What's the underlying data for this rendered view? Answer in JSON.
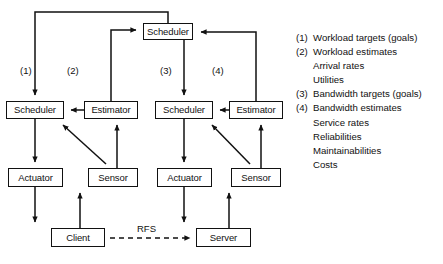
{
  "diagram": {
    "stroke_color": "#111111",
    "background_color": "#ffffff",
    "nodes": [
      {
        "id": "global-scheduler",
        "label": "Scheduler",
        "x": 143,
        "y": 23,
        "w": 50,
        "h": 17
      },
      {
        "id": "left-scheduler",
        "label": "Scheduler",
        "x": 6,
        "y": 101,
        "w": 58,
        "h": 18
      },
      {
        "id": "left-estimator",
        "label": "Estimator",
        "x": 84,
        "y": 101,
        "w": 54,
        "h": 18
      },
      {
        "id": "right-scheduler",
        "label": "Scheduler",
        "x": 155,
        "y": 101,
        "w": 58,
        "h": 18
      },
      {
        "id": "right-estimator",
        "label": "Estimator",
        "x": 229,
        "y": 101,
        "w": 54,
        "h": 18
      },
      {
        "id": "left-actuator",
        "label": "Actuator",
        "x": 8,
        "y": 168,
        "w": 55,
        "h": 19
      },
      {
        "id": "left-sensor",
        "label": "Sensor",
        "x": 88,
        "y": 168,
        "w": 50,
        "h": 19
      },
      {
        "id": "right-actuator",
        "label": "Actuator",
        "x": 157,
        "y": 168,
        "w": 55,
        "h": 19
      },
      {
        "id": "right-sensor",
        "label": "Sensor",
        "x": 231,
        "y": 168,
        "w": 50,
        "h": 19
      },
      {
        "id": "client",
        "label": "Client",
        "x": 51,
        "y": 228,
        "w": 54,
        "h": 19
      },
      {
        "id": "server",
        "label": "Server",
        "x": 196,
        "y": 228,
        "w": 55,
        "h": 19
      }
    ],
    "connector_labels": [
      {
        "id": "label-1",
        "text": "(1)",
        "x": 20,
        "y": 66
      },
      {
        "id": "label-2",
        "text": "(2)",
        "x": 67,
        "y": 66
      },
      {
        "id": "label-3",
        "text": "(3)",
        "x": 160,
        "y": 66
      },
      {
        "id": "label-4",
        "text": "(4)",
        "x": 212,
        "y": 66
      }
    ],
    "edge_labels": [
      {
        "id": "rfs",
        "text": "RFS",
        "x": 136,
        "y": 224
      }
    ]
  },
  "legend": {
    "rows": [
      {
        "marker": "(1)",
        "text": "Workload targets (goals)",
        "sub": false
      },
      {
        "marker": "(2)",
        "text": "Workload estimates",
        "sub": false
      },
      {
        "marker": "",
        "text": "Arrival rates",
        "sub": true
      },
      {
        "marker": "",
        "text": "Utilities",
        "sub": true
      },
      {
        "marker": "(3)",
        "text": "Bandwidth targets (goals)",
        "sub": false
      },
      {
        "marker": "(4)",
        "text": "Bandwidth estimates",
        "sub": false
      },
      {
        "marker": "",
        "text": "Service rates",
        "sub": true
      },
      {
        "marker": "",
        "text": "Reliabilities",
        "sub": true
      },
      {
        "marker": "",
        "text": "Maintainabilities",
        "sub": true
      },
      {
        "marker": "",
        "text": "Costs",
        "sub": true
      }
    ]
  }
}
